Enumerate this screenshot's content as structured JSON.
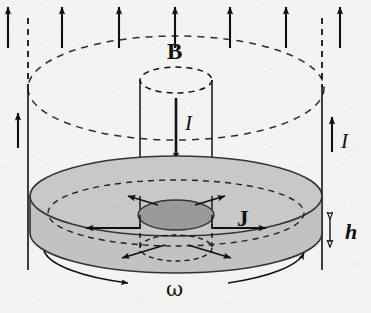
{
  "figure": {
    "background_color": "#f4f3f1",
    "ink_color": "#111111",
    "disk_fill": "#c8c8c8",
    "disk_side_fill": "#c2c2c2",
    "electrode_fill": "#9a9a9a",
    "width": 371,
    "height": 313
  },
  "labels": {
    "b_field": "B",
    "current_center": "I",
    "current_return": "I",
    "current_density": "J",
    "thickness": "h",
    "angular_velocity": "ω"
  },
  "annotations": {
    "b_field": {
      "symbol": "B",
      "meaning": "uniform axial magnetic field",
      "direction": "upward",
      "arrow_count": 7,
      "arrow_x_positions": [
        8,
        62,
        119,
        175,
        230,
        286,
        340
      ],
      "arrow_top_y": 6,
      "arrow_bottom_y": 48
    },
    "current_center": {
      "symbol": "I",
      "meaning": "current down the central axial conductor",
      "direction": "downward"
    },
    "current_return": {
      "symbol": "I",
      "meaning": "return current up the outer conductor",
      "direction": "upward"
    },
    "current_density": {
      "symbol": "J",
      "meaning": "radial current density in the disk",
      "direction": "radially outward",
      "arrow_count": 6
    },
    "thickness": {
      "symbol": "h",
      "meaning": "disk thickness",
      "marker": "double-headed hollow vertical arrow"
    },
    "angular_velocity": {
      "symbol": "ω",
      "meaning": "disk rotation rate about the vertical axis",
      "marker": "curved arc arrows around the disk rim"
    }
  },
  "geometry": {
    "disk": {
      "center_x": 176,
      "top_ellipse_cy": 196,
      "bottom_ellipse_cy": 233,
      "rx": 146,
      "ry": 40
    },
    "electrode": {
      "cx": 176,
      "cy": 215,
      "rx": 38,
      "ry": 15
    },
    "central_cylinder": {
      "left_x": 140,
      "right_x": 212,
      "top_cy": 80,
      "ry": 13
    },
    "field_ellipse": {
      "cx": 176,
      "cy": 88,
      "rx": 148,
      "ry": 52
    },
    "outer_conductors": {
      "left_x": 28,
      "right_x": 322
    }
  }
}
